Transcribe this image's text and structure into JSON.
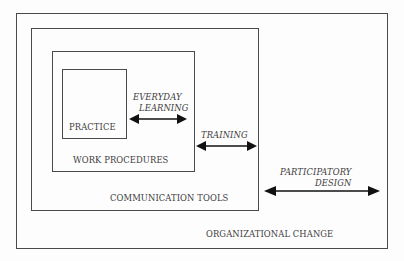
{
  "diagram": {
    "boxes": {
      "organizational_change": {
        "label": "ORGANIZATIONAL CHANGE"
      },
      "communication_tools": {
        "label": "COMMUNICATION TOOLS"
      },
      "work_procedures": {
        "label": "WORK PROCEDURES"
      },
      "practice": {
        "label": "PRACTICE"
      }
    },
    "arrows": {
      "everyday_learning": {
        "line1": "EVERYDAY",
        "line2": "LEARNING"
      },
      "training": {
        "line1": "TRAINING"
      },
      "participatory_design": {
        "line1": "PARTICIPATORY",
        "line2": "DESIGN"
      }
    },
    "colors": {
      "stroke": "#4a4a4a",
      "text": "#3c3c3c",
      "arrow": "#111111",
      "background": "#fdfdfd"
    }
  }
}
